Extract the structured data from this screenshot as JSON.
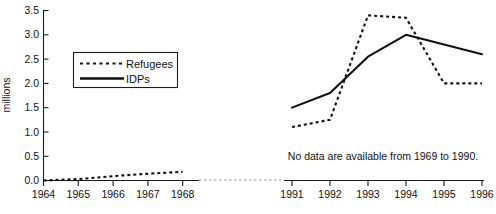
{
  "chart_data": {
    "type": "line",
    "title": "",
    "xlabel": "",
    "ylabel": "millions",
    "ylim": [
      0.0,
      3.5
    ],
    "grid": false,
    "legend_position": "upper-left-inside",
    "x": [
      1964,
      1965,
      1966,
      1967,
      1968,
      1991,
      1992,
      1993,
      1994,
      1995,
      1996
    ],
    "x_tick_labels": [
      "1964",
      "1965",
      "1966",
      "1967",
      "1968",
      "1991",
      "1992",
      "1993",
      "1994",
      "1995",
      "1996"
    ],
    "y_tick_labels": [
      "0.0",
      "0.5",
      "1.0",
      "1.5",
      "2.0",
      "2.5",
      "3.0",
      "3.5"
    ],
    "y_tick_values": [
      0.0,
      0.5,
      1.0,
      1.5,
      2.0,
      2.5,
      3.0,
      3.5
    ],
    "break_note": "No data are available from 1969 to 1990.",
    "series": [
      {
        "name": "Refugees",
        "style": "dotted",
        "segments": [
          {
            "x": [
              1964,
              1965,
              1966,
              1967,
              1968
            ],
            "values": [
              0.0,
              0.03,
              0.09,
              0.14,
              0.18
            ]
          },
          {
            "x": [
              1991,
              1992,
              1993,
              1994,
              1995,
              1996
            ],
            "values": [
              1.1,
              1.25,
              3.4,
              3.35,
              2.0,
              2.0
            ]
          }
        ]
      },
      {
        "name": "IDPs",
        "style": "solid",
        "segments": [
          {
            "x": [
              1991,
              1992,
              1993,
              1994,
              1995,
              1996
            ],
            "values": [
              1.5,
              1.8,
              2.55,
              3.0,
              2.8,
              2.6
            ]
          }
        ]
      }
    ]
  },
  "axis": {
    "y_label": "millions",
    "y_ticks": [
      "3.5",
      "3.0",
      "2.5",
      "2.0",
      "1.5",
      "1.0",
      "0.5",
      "0.0"
    ],
    "x_ticks_left": [
      "1964",
      "1965",
      "1966",
      "1967",
      "1968"
    ],
    "x_ticks_right": [
      "1991",
      "1992",
      "1993",
      "1994",
      "1995",
      "1996"
    ]
  },
  "legend": {
    "entries": [
      {
        "label": "Refugees",
        "style": "dotted"
      },
      {
        "label": "IDPs",
        "style": "solid"
      }
    ],
    "refugees_label": "Refugees",
    "idps_label": "IDPs"
  },
  "annotation": {
    "no_data_note": "No data are available from 1969 to 1990."
  }
}
